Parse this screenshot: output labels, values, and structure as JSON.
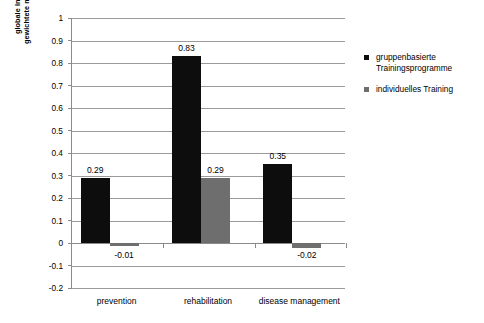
{
  "chart_data": {
    "type": "bar",
    "title": "",
    "subtitle": "",
    "xlabel": "",
    "ylabel_lines": [
      "globale Indikatoren  der Lebensqualität:",
      "gewichtete mittlere Effektstärken EXP vs. KG"
    ],
    "categories": [
      "prevention",
      "rehabilitation",
      "disease management"
    ],
    "series": [
      {
        "name": "gruppenbasierte Trainingsprogramme",
        "name_lines": [
          "gruppenbasierte",
          "Trainingsprogramme"
        ],
        "color": "#0d0d0d",
        "values": [
          0.29,
          0.83,
          0.35
        ],
        "labels": [
          "0.29",
          "0.83",
          "0.35"
        ]
      },
      {
        "name": "individuelles Training",
        "name_lines": [
          "individuelles Training"
        ],
        "color": "#6e6e6e",
        "values": [
          -0.01,
          0.29,
          -0.02
        ],
        "labels": [
          "-0.01",
          "0.29",
          "-0.02"
        ]
      }
    ],
    "ylim": [
      -0.2,
      1.0
    ],
    "yticks": [
      1,
      0.9,
      0.8,
      0.7,
      0.6,
      0.5,
      0.4,
      0.3,
      0.2,
      0.1,
      0,
      -0.1,
      -0.2
    ],
    "ytick_labels": [
      "1",
      "0.9",
      "0.8",
      "0.7",
      "0.6",
      "0.5",
      "0.4",
      "0.3",
      "0.2",
      "0.1",
      "0",
      "-0.1",
      "-0.2"
    ],
    "grid": true,
    "legend_position": "right"
  }
}
